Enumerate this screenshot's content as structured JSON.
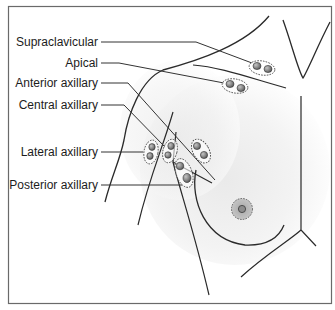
{
  "diagram": {
    "type": "anatomical-illustration",
    "colors": {
      "frame": "#6a6a6a",
      "outline": "#2a2a2a",
      "leader_line": "#333333",
      "node_fill": "#8a8a8a",
      "node_highlight": "#b5b5b5",
      "node_ring": "#444444",
      "areola_fill": "#b0b0b0",
      "nipple_fill": "#8c8c8c",
      "skin_shade": "#ececec"
    },
    "labels": [
      {
        "id": "supraclavicular",
        "text": "Supraclavicular"
      },
      {
        "id": "apical",
        "text": "Apical"
      },
      {
        "id": "anterior-axillary",
        "text": "Anterior axillary"
      },
      {
        "id": "central-axillary",
        "text": "Central axillary"
      },
      {
        "id": "lateral-axillary",
        "text": "Lateral axillary"
      },
      {
        "id": "posterior-axillary",
        "text": "Posterior axillary"
      }
    ]
  }
}
